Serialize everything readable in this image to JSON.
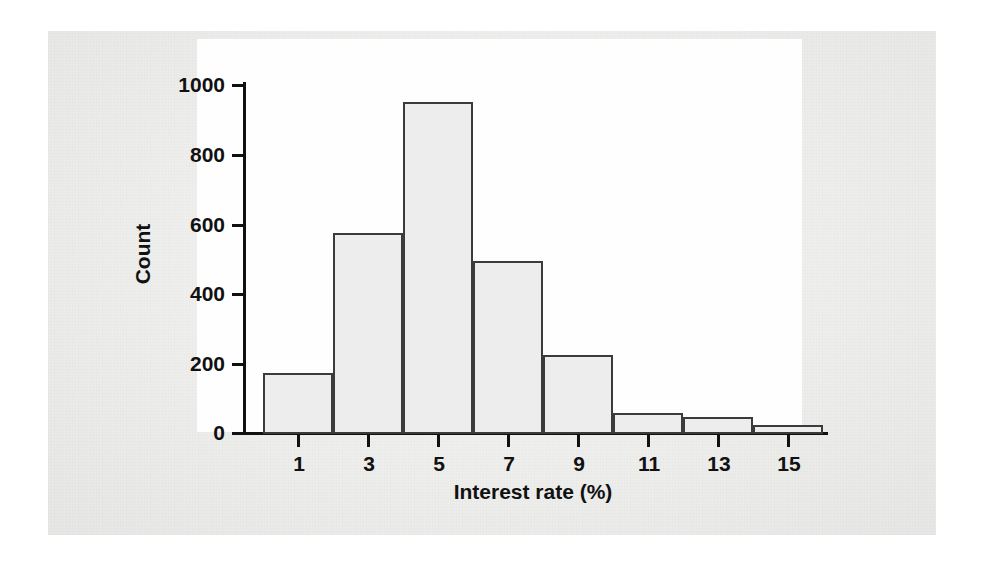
{
  "chart_data": {
    "type": "bar",
    "title": "",
    "xlabel": "Interest rate (%)",
    "ylabel": "Count",
    "categories": [
      "1",
      "3",
      "5",
      "7",
      "9",
      "11",
      "13",
      "15"
    ],
    "bin_edges": [
      0,
      2,
      4,
      6,
      8,
      10,
      12,
      14,
      16
    ],
    "bin_width": 2,
    "values": [
      175,
      575,
      950,
      495,
      225,
      60,
      50,
      25
    ],
    "x_tick_labels": [
      "1",
      "3",
      "5",
      "7",
      "9",
      "11",
      "13",
      "15"
    ],
    "x_tick_values": [
      1,
      3,
      5,
      7,
      9,
      11,
      13,
      15
    ],
    "y_tick_labels": [
      "1000",
      "800",
      "600",
      "400",
      "200",
      "0"
    ],
    "y_tick_values": [
      1000,
      800,
      600,
      400,
      200,
      0
    ],
    "xlim": [
      0,
      17
    ],
    "ylim": [
      0,
      1000
    ],
    "grid": false,
    "legend": false,
    "bar_fill_color": "#ededed",
    "bar_edge_color": "#3b3b3b",
    "axis_color": "#111111",
    "plot_background": "#fefefe",
    "page_background": "#ececeb"
  }
}
